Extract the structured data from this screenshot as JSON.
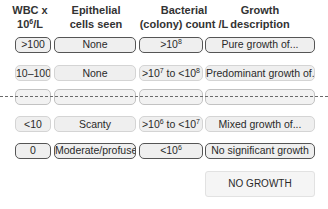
{
  "headers": {
    "wbc": {
      "line1": "WBC x",
      "line2_base": "10",
      "line2_exp": "6",
      "line2_rest": "/L"
    },
    "epithelial": {
      "line1": "Epithelial",
      "line2": "cells seen"
    },
    "bacterial": {
      "line1": "Bacterial",
      "line2": "(colony) count /L"
    },
    "growth": {
      "line1": "Growth",
      "line2": "description"
    }
  },
  "rows": [
    {
      "style": "dark",
      "wbc": ">100",
      "epithelial": "None",
      "bacterial": {
        "pre": ">10",
        "exp": "8",
        "mid": "",
        "exp2": "",
        "post": ""
      },
      "growth": "Pure growth of..."
    },
    {
      "style": "light",
      "wbc": "10–100",
      "epithelial": "None",
      "bacterial": {
        "pre": ">10",
        "exp": "7",
        "mid": " to <10",
        "exp2": "8",
        "post": ""
      },
      "growth": "Predominant growth of..."
    },
    {
      "style": "dash",
      "wbc": "",
      "epithelial": "",
      "bacterial": {
        "pre": "",
        "exp": "",
        "mid": "",
        "exp2": "",
        "post": ""
      },
      "growth": ""
    },
    {
      "style": "light",
      "wbc": "<10",
      "epithelial": "Scanty",
      "bacterial": {
        "pre": ">10",
        "exp": "6",
        "mid": " to <10",
        "exp2": "7",
        "post": ""
      },
      "growth": "Mixed growth of..."
    },
    {
      "style": "dark",
      "wbc": "0",
      "epithelial": "Moderate/profuse",
      "bacterial": {
        "pre": "<10",
        "exp": "6",
        "mid": "",
        "exp2": "",
        "post": ""
      },
      "growth": "No significant growth"
    }
  ],
  "extra": {
    "no_growth": "NO GROWTH"
  }
}
